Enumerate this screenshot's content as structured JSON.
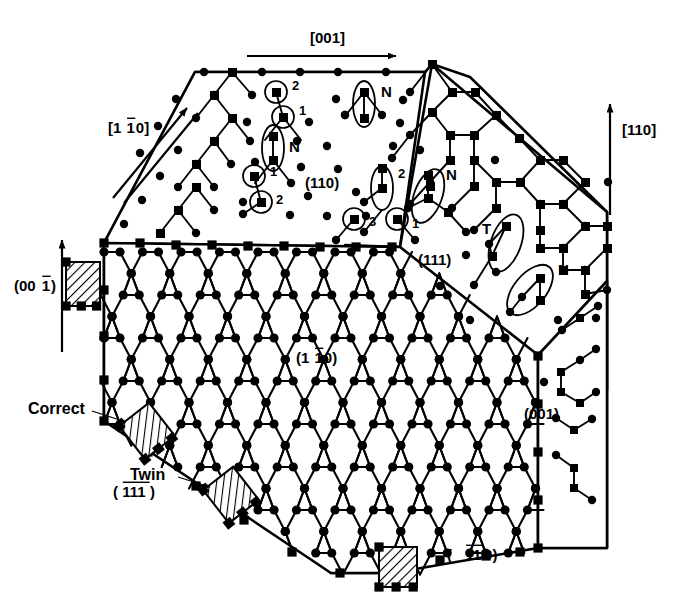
{
  "figure": {
    "type": "diagram",
    "background_color": "#ffffff",
    "ink_color": "#000000"
  },
  "direction_arrows": [
    {
      "id": "dir-001",
      "label": "[001]",
      "label_parts": [
        {
          "t": "[001]",
          "bar": false
        }
      ],
      "x": 310,
      "y": 43,
      "orientation": "horizontal-right"
    },
    {
      "id": "dir-1b10",
      "label": "[1̅1̅0]",
      "label_parts": [
        {
          "t": "[1",
          "bar": false
        },
        {
          "t": "1",
          "bar": true
        },
        {
          "t": "0]",
          "bar": false
        }
      ],
      "x": 108,
      "y": 133,
      "orientation": "diagonal-up-right"
    },
    {
      "id": "dir-110",
      "label": "[110]",
      "label_parts": [
        {
          "t": "[110]",
          "bar": false
        }
      ],
      "x": 622,
      "y": 135,
      "orientation": "vertical-up"
    },
    {
      "id": "dir-00b1",
      "label": "(001̅)",
      "label_parts": [
        {
          "t": "(00",
          "bar": false
        },
        {
          "t": "1",
          "bar": true
        },
        {
          "t": ")",
          "bar": false
        }
      ],
      "x": 14,
      "y": 291,
      "orientation": "vertical-up"
    }
  ],
  "facet_labels": [
    {
      "id": "facet-110",
      "text": "(110)",
      "parts": [
        {
          "t": "(110)",
          "bar": false
        }
      ],
      "x": 305,
      "y": 188
    },
    {
      "id": "facet-111",
      "text": "(111)",
      "parts": [
        {
          "t": "(111)",
          "bar": false
        }
      ],
      "x": 418,
      "y": 265
    },
    {
      "id": "facet-1b10",
      "text": "(11̅0)",
      "parts": [
        {
          "t": "(1",
          "bar": false
        },
        {
          "t": "1",
          "bar": true
        },
        {
          "t": "0)",
          "bar": false
        }
      ],
      "x": 296,
      "y": 363
    },
    {
      "id": "facet-b1b1b1",
      "text": "(1̅1̅1̅)",
      "parts": [
        {
          "t": "(",
          "bar": false
        },
        {
          "t": "111",
          "bar": true
        },
        {
          "t": ")",
          "bar": false
        }
      ],
      "x": 113,
      "y": 497
    },
    {
      "id": "facet-b1b10",
      "text": "(1̅1̅0)",
      "parts": [
        {
          "t": "( ",
          "bar": false
        },
        {
          "t": "11",
          "bar": true
        },
        {
          "t": "0)",
          "bar": false
        }
      ],
      "x": 447,
      "y": 560
    },
    {
      "id": "facet-001",
      "text": "(001)",
      "parts": [
        {
          "t": "(001)",
          "bar": false
        }
      ],
      "x": 524,
      "y": 419
    }
  ],
  "callouts": [
    {
      "id": "callout-correct",
      "text": "Correct",
      "x": 28,
      "y": 414,
      "arrow_from": [
        92,
        412
      ],
      "arrow_to": [
        128,
        424
      ]
    },
    {
      "id": "callout-twin",
      "text": "Twin",
      "x": 130,
      "y": 480,
      "arrow_from": [
        178,
        478
      ],
      "arrow_to": [
        212,
        488
      ]
    }
  ],
  "site_markers": [
    {
      "id": "m-110-2a",
      "label": "2",
      "shape": "circle",
      "cx": 276,
      "cy": 92,
      "r": 11,
      "label_x": 292,
      "label_y": 90
    },
    {
      "id": "m-110-1a",
      "label": "1",
      "shape": "circle",
      "cx": 283,
      "cy": 117,
      "r": 11,
      "label_x": 299,
      "label_y": 115
    },
    {
      "id": "m-110-N1",
      "label": "N",
      "shape": "ellipse",
      "cx": 273,
      "cy": 148,
      "rx": 11,
      "ry": 23,
      "rot": 0,
      "label_x": 289,
      "label_y": 152
    },
    {
      "id": "m-110-1b",
      "label": "1",
      "shape": "circle",
      "cx": 254,
      "cy": 176,
      "r": 11,
      "label_x": 270,
      "label_y": 176
    },
    {
      "id": "m-110-2b",
      "label": "2",
      "shape": "circle",
      "cx": 261,
      "cy": 202,
      "r": 11,
      "label_x": 276,
      "label_y": 204
    },
    {
      "id": "m-110-N2",
      "label": "N",
      "shape": "ellipse",
      "cx": 364,
      "cy": 104,
      "rx": 11,
      "ry": 23,
      "rot": 0,
      "label_x": 381,
      "label_y": 97
    },
    {
      "id": "m-111-2",
      "label": "2",
      "shape": "ellipse",
      "cx": 382,
      "cy": 188,
      "rx": 11,
      "ry": 22,
      "rot": 0,
      "label_x": 398,
      "label_y": 178
    },
    {
      "id": "m-111-3",
      "label": "3",
      "shape": "circle",
      "cx": 354,
      "cy": 219,
      "r": 11,
      "label_x": 369,
      "label_y": 226
    },
    {
      "id": "m-111-1",
      "label": "1",
      "shape": "circle",
      "cx": 397,
      "cy": 219,
      "r": 11,
      "label_x": 412,
      "label_y": 228
    },
    {
      "id": "m-111-N1",
      "label": "N",
      "shape": "ellipse",
      "cx": 428,
      "cy": 196,
      "rx": 14,
      "ry": 28,
      "rot": 20,
      "label_x": 446,
      "label_y": 180
    },
    {
      "id": "m-111-T",
      "label": "T",
      "shape": "ellipse",
      "cx": 506,
      "cy": 243,
      "rx": 15,
      "ry": 30,
      "rot": 20,
      "label_x": 482,
      "label_y": 234
    },
    {
      "id": "m-111-N2",
      "label": "N",
      "shape": "ellipse",
      "cx": 530,
      "cy": 290,
      "rx": 16,
      "ry": 30,
      "rot": 40,
      "label_x": 558,
      "label_y": 275
    }
  ],
  "hatched_steps": [
    {
      "id": "step-00b1",
      "x": 66,
      "y": 262,
      "w": 34,
      "h": 44,
      "note": "edge step on (001-bar) face"
    },
    {
      "id": "step-correct",
      "x": 128,
      "y": 410,
      "w": 38,
      "h": 42,
      "note": "Correct stacking step"
    },
    {
      "id": "step-twin",
      "x": 212,
      "y": 474,
      "w": 38,
      "h": 42,
      "note": "Twin stacking step"
    },
    {
      "id": "step-bottom",
      "x": 379,
      "y": 547,
      "w": 38,
      "h": 40,
      "note": "bottom edge step"
    }
  ],
  "legend_note": {
    "square_atom": "second-layer / dimer atom (filled square)",
    "round_atom": "surface atom (filled circle)",
    "N": "N-type site",
    "T": "twin site",
    "1": "site type 1",
    "2": "site type 2",
    "3": "site type 3"
  },
  "chart_data": {
    "type": "diagram",
    "facets": [
      "(110)",
      "(111)",
      "(11̅0)",
      "(1̅1̅1̅)",
      "(1̅1̅0)",
      "(001)",
      "(001̅)"
    ],
    "directions": [
      "[001]",
      "[1̅1̅0]",
      "[110]"
    ],
    "annotations": [
      "N",
      "T",
      "1",
      "2",
      "3",
      "Correct",
      "Twin"
    ]
  }
}
